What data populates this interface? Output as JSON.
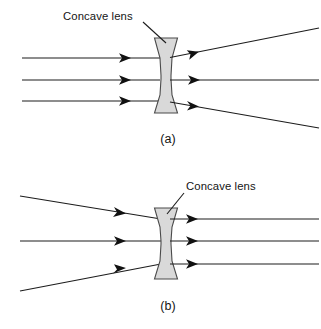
{
  "figure": {
    "background_color": "#ffffff",
    "stroke_color": "#1c1c1c",
    "lens_fill_color": "#d9d9d9",
    "lens_stroke_color": "#4a4a4a",
    "width": 321,
    "height": 329
  },
  "panels": [
    {
      "id": "a",
      "caption": "(a)",
      "caption_x": 168,
      "caption_y": 143,
      "annotation": {
        "label": "Concave lens",
        "label_x": 63,
        "label_y": 20,
        "pointer_from_x": 143,
        "pointer_from_y": 22,
        "pointer_to_x": 165,
        "pointer_to_y": 43
      },
      "lens": {
        "center_x": 166,
        "top_y": 38,
        "bottom_y": 113,
        "outer_half_width": 11.5,
        "waist_half_width": 5.0
      },
      "incoming_description": "three parallel rays travelling left to right",
      "outgoing_description": "rays diverge after the concave lens",
      "rays": [
        {
          "name": "upper-ray",
          "in_start_x": 22,
          "in_start_y": 58,
          "in_end_x": 160,
          "in_end_y": 58,
          "arrow_x": 128,
          "arrow_y": 58,
          "arrow_angle": 0,
          "out_start_x": 172,
          "out_start_y": 57,
          "out_end_x": 319,
          "out_end_y": 28,
          "out_arrow_x": 199,
          "out_arrow_y": 51.6,
          "out_arrow_angle": -11.2
        },
        {
          "name": "middle-ray",
          "in_start_x": 22,
          "in_start_y": 80,
          "in_end_x": 160,
          "in_end_y": 80,
          "arrow_x": 128,
          "arrow_y": 80,
          "arrow_angle": 0,
          "out_start_x": 172,
          "out_start_y": 80,
          "out_end_x": 319,
          "out_end_y": 80,
          "out_arrow_x": 199,
          "out_arrow_y": 80,
          "out_arrow_angle": 0
        },
        {
          "name": "lower-ray",
          "in_start_x": 22,
          "in_start_y": 101,
          "in_end_x": 160,
          "in_end_y": 101,
          "arrow_x": 128,
          "arrow_y": 101,
          "arrow_angle": 0,
          "out_start_x": 172,
          "out_start_y": 102,
          "out_end_x": 319,
          "out_end_y": 128,
          "out_arrow_x": 199,
          "out_arrow_y": 106.8,
          "out_arrow_angle": 10.0
        }
      ]
    },
    {
      "id": "b",
      "caption": "(b)",
      "caption_x": 168,
      "caption_y": 310,
      "annotation": {
        "label": "Concave lens",
        "label_x": 186,
        "label_y": 186,
        "pointer_from_x": 184,
        "pointer_from_y": 191,
        "pointer_to_x": 166,
        "pointer_to_y": 213
      },
      "lens": {
        "center_x": 166,
        "top_y": 208,
        "bottom_y": 279,
        "outer_half_width": 11.5,
        "waist_half_width": 5.0
      },
      "incoming_description": "three converging rays travelling left to right",
      "outgoing_description": "rays emerge parallel after the concave lens",
      "rays": [
        {
          "name": "upper-ray",
          "in_start_x": 20,
          "in_start_y": 196,
          "in_end_x": 160,
          "in_end_y": 219,
          "arrow_x": 123,
          "arrow_y": 213,
          "arrow_angle": 9.3,
          "out_start_x": 172,
          "out_start_y": 219,
          "out_end_x": 319,
          "out_end_y": 219,
          "out_arrow_x": 197,
          "out_arrow_y": 219,
          "out_arrow_angle": 0
        },
        {
          "name": "middle-ray",
          "in_start_x": 20,
          "in_start_y": 241,
          "in_end_x": 160,
          "in_end_y": 241,
          "arrow_x": 123,
          "arrow_y": 241,
          "arrow_angle": 0,
          "out_start_x": 172,
          "out_start_y": 241,
          "out_end_x": 319,
          "out_end_y": 241,
          "out_arrow_x": 197,
          "out_arrow_y": 241,
          "out_arrow_angle": 0
        },
        {
          "name": "lower-ray",
          "in_start_x": 20,
          "in_start_y": 291,
          "in_end_x": 160,
          "in_end_y": 264,
          "arrow_x": 123,
          "arrow_y": 270.3,
          "arrow_angle": -9.7,
          "out_start_x": 172,
          "out_start_y": 264,
          "out_end_x": 319,
          "out_end_y": 264,
          "out_arrow_x": 197,
          "out_arrow_y": 264,
          "out_arrow_angle": 0
        }
      ]
    }
  ]
}
